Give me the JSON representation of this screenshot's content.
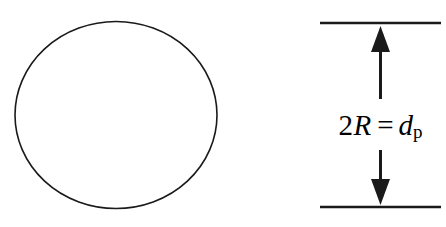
{
  "figure": {
    "background_color": "#ffffff",
    "stroke_color": "#1a1a1a",
    "width": 446,
    "height": 227
  },
  "particle": {
    "shape_name": "circle",
    "center_x": 116,
    "center_y": 115,
    "radius_x": 101,
    "radius_y": 93.5,
    "stroke_width": 1.6,
    "fill": "none"
  },
  "dimension": {
    "label_parts": {
      "coefficient": "2",
      "radius_symbol": "R",
      "equals": "=",
      "diameter_symbol": "d",
      "subscript": "p"
    },
    "label_plain": "2R = d_p",
    "top_rule": {
      "x1": 320,
      "x2": 441,
      "y": 23,
      "stroke_width": 2.4
    },
    "bottom_rule": {
      "x1": 320,
      "x2": 441,
      "y": 207,
      "stroke_width": 2.4
    },
    "up_arrow": {
      "x": 380.5,
      "tip_y": 26,
      "tail_y": 99,
      "shaft_width": 3,
      "head_width": 19,
      "head_height": 26
    },
    "down_arrow": {
      "x": 380.5,
      "tip_y": 205,
      "tail_y": 150,
      "shaft_width": 3,
      "head_width": 19,
      "head_height": 26
    }
  }
}
